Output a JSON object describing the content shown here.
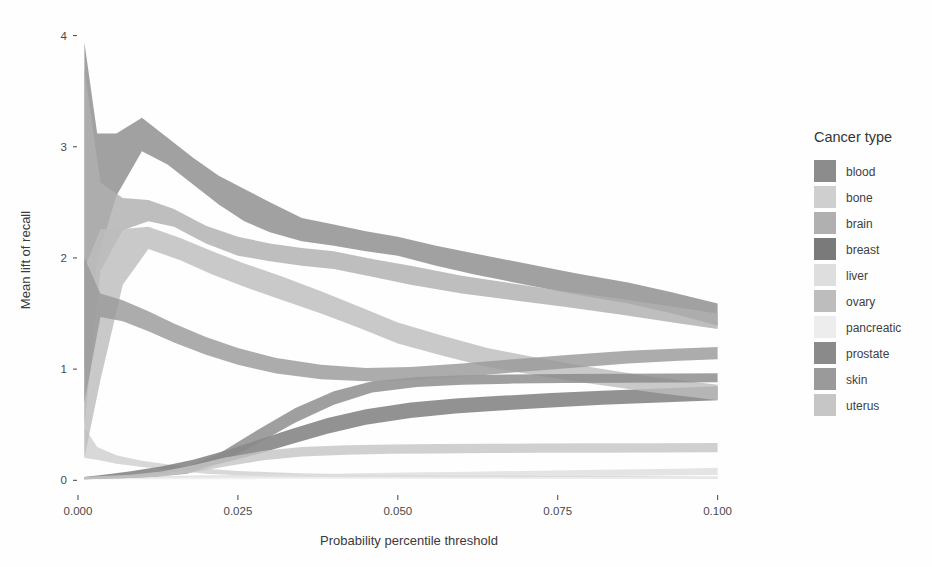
{
  "chart_data": {
    "type": "area",
    "title": "",
    "xlabel": "Probability percentile threshold",
    "ylabel": "Mean lift of recall",
    "xlim": [
      0.0,
      0.1035
    ],
    "ylim": [
      -0.06,
      4.05
    ],
    "xticks": [
      0.0,
      0.025,
      0.05,
      0.075,
      0.1
    ],
    "xtick_labels": [
      "0.000",
      "0.025",
      "0.050",
      "0.075",
      "0.100"
    ],
    "yticks": [
      0,
      1,
      2,
      3,
      4
    ],
    "ytick_labels": [
      "0",
      "1",
      "2",
      "3",
      "4"
    ],
    "grid": false,
    "legend_position": "right",
    "legend_title": "Cancer type",
    "band_semantics": "each series is a shaded ribbon (confidence interval) between lower and upper bounds",
    "series": [
      {
        "name": "blood",
        "color": "#8c8c8c",
        "x": [
          0.001,
          0.003,
          0.006,
          0.01,
          0.014,
          0.018,
          0.022,
          0.026,
          0.03,
          0.035,
          0.04,
          0.045,
          0.05,
          0.056,
          0.062,
          0.07,
          0.078,
          0.086,
          0.093,
          0.1
        ],
        "lower": [
          0.98,
          1.98,
          2.56,
          2.96,
          2.84,
          2.66,
          2.48,
          2.33,
          2.23,
          2.15,
          2.11,
          2.06,
          2.02,
          1.93,
          1.85,
          1.76,
          1.67,
          1.59,
          1.5,
          1.39
        ],
        "upper": [
          3.94,
          3.12,
          3.12,
          3.26,
          3.08,
          2.9,
          2.74,
          2.62,
          2.5,
          2.36,
          2.3,
          2.24,
          2.19,
          2.11,
          2.04,
          1.95,
          1.86,
          1.78,
          1.69,
          1.59
        ],
        "mean": [
          2.46,
          2.55,
          2.84,
          3.11,
          2.96,
          2.78,
          2.61,
          2.475,
          2.365,
          2.255,
          2.205,
          2.15,
          2.105,
          2.02,
          1.945,
          1.855,
          1.765,
          1.685,
          1.595,
          1.49
        ]
      },
      {
        "name": "bone",
        "color": "#cfcfcf",
        "x": [
          0.001,
          0.003,
          0.006,
          0.01,
          0.015,
          0.02,
          0.025,
          0.03,
          0.036,
          0.042,
          0.05,
          0.058,
          0.066,
          0.074,
          0.083,
          0.092,
          0.1
        ],
        "lower": [
          0.2,
          0.185,
          0.15,
          0.12,
          0.09,
          0.06,
          0.045,
          0.035,
          0.03,
          0.026,
          0.024,
          0.022,
          0.02,
          0.018,
          0.016,
          0.014,
          0.012
        ],
        "upper": [
          0.48,
          0.3,
          0.225,
          0.175,
          0.135,
          0.105,
          0.085,
          0.072,
          0.062,
          0.055,
          0.05,
          0.046,
          0.043,
          0.04,
          0.038,
          0.036,
          0.035
        ],
        "mean": [
          0.34,
          0.243,
          0.188,
          0.148,
          0.113,
          0.083,
          0.065,
          0.054,
          0.046,
          0.041,
          0.037,
          0.034,
          0.032,
          0.029,
          0.027,
          0.025,
          0.024
        ]
      },
      {
        "name": "brain",
        "color": "#b0b0b0",
        "x": [
          0.001,
          0.0035,
          0.007,
          0.011,
          0.015,
          0.02,
          0.025,
          0.03,
          0.035,
          0.04,
          0.046,
          0.052,
          0.06,
          0.068,
          0.076,
          0.085,
          0.093,
          0.1
        ],
        "lower": [
          0.48,
          1.88,
          2.25,
          2.33,
          2.28,
          2.13,
          2.02,
          1.97,
          1.93,
          1.9,
          1.83,
          1.76,
          1.68,
          1.62,
          1.56,
          1.49,
          1.42,
          1.36
        ],
        "upper": [
          3.7,
          2.68,
          2.54,
          2.52,
          2.44,
          2.29,
          2.19,
          2.13,
          2.09,
          2.06,
          1.99,
          1.93,
          1.84,
          1.77,
          1.7,
          1.63,
          1.56,
          1.5
        ],
        "mean": [
          2.09,
          2.28,
          2.395,
          2.425,
          2.36,
          2.21,
          2.105,
          2.05,
          2.01,
          1.98,
          1.91,
          1.845,
          1.76,
          1.695,
          1.63,
          1.56,
          1.49,
          1.43
        ]
      },
      {
        "name": "breast",
        "color": "#7a7a7a",
        "x": [
          0.001,
          0.004,
          0.008,
          0.013,
          0.018,
          0.023,
          0.028,
          0.033,
          0.039,
          0.045,
          0.052,
          0.059,
          0.066,
          0.074,
          0.082,
          0.091,
          0.1
        ],
        "lower": [
          0.01,
          0.02,
          0.035,
          0.06,
          0.1,
          0.16,
          0.235,
          0.32,
          0.42,
          0.5,
          0.56,
          0.6,
          0.628,
          0.655,
          0.68,
          0.7,
          0.72
        ],
        "upper": [
          0.03,
          0.05,
          0.08,
          0.125,
          0.185,
          0.265,
          0.36,
          0.455,
          0.56,
          0.64,
          0.7,
          0.735,
          0.76,
          0.785,
          0.805,
          0.825,
          0.845
        ],
        "mean": [
          0.02,
          0.035,
          0.058,
          0.093,
          0.143,
          0.213,
          0.298,
          0.388,
          0.49,
          0.57,
          0.63,
          0.668,
          0.694,
          0.72,
          0.743,
          0.763,
          0.783
        ]
      },
      {
        "name": "liver",
        "color": "#dedede",
        "x": [
          0.001,
          0.004,
          0.008,
          0.013,
          0.019,
          0.025,
          0.032,
          0.039,
          0.046,
          0.054,
          0.062,
          0.07,
          0.079,
          0.088,
          0.094,
          0.1
        ],
        "lower": [
          0.01,
          0.012,
          0.015,
          0.018,
          0.02,
          0.022,
          0.024,
          0.026,
          0.028,
          0.03,
          0.032,
          0.035,
          0.038,
          0.042,
          0.045,
          0.048
        ],
        "upper": [
          0.03,
          0.032,
          0.036,
          0.04,
          0.044,
          0.048,
          0.054,
          0.06,
          0.066,
          0.072,
          0.078,
          0.085,
          0.092,
          0.1,
          0.105,
          0.112
        ],
        "mean": [
          0.02,
          0.022,
          0.026,
          0.029,
          0.032,
          0.035,
          0.039,
          0.043,
          0.047,
          0.051,
          0.055,
          0.06,
          0.065,
          0.071,
          0.075,
          0.08
        ]
      },
      {
        "name": "ovary",
        "color": "#bdbdbd",
        "x": [
          0.001,
          0.0035,
          0.007,
          0.011,
          0.016,
          0.021,
          0.026,
          0.032,
          0.038,
          0.044,
          0.05,
          0.057,
          0.064,
          0.072,
          0.08,
          0.09,
          0.1
        ],
        "lower": [
          0.2,
          0.9,
          1.76,
          2.08,
          1.98,
          1.85,
          1.74,
          1.62,
          1.5,
          1.37,
          1.23,
          1.12,
          1.02,
          0.94,
          0.87,
          0.79,
          0.72
        ],
        "upper": [
          1.9,
          2.26,
          2.26,
          2.28,
          2.18,
          2.06,
          1.95,
          1.83,
          1.7,
          1.56,
          1.42,
          1.3,
          1.19,
          1.1,
          1.02,
          0.93,
          0.86
        ],
        "mean": [
          1.05,
          1.58,
          2.01,
          2.18,
          2.08,
          1.955,
          1.845,
          1.725,
          1.6,
          1.465,
          1.325,
          1.21,
          1.105,
          1.02,
          0.945,
          0.86,
          0.79
        ]
      },
      {
        "name": "pancreatic",
        "color": "#ededed",
        "x": [
          0.001,
          0.005,
          0.01,
          0.016,
          0.022,
          0.029,
          0.036,
          0.044,
          0.052,
          0.06,
          0.069,
          0.078,
          0.088,
          0.1
        ],
        "lower": [
          0.01,
          0.01,
          0.01,
          0.01,
          0.01,
          0.011,
          0.011,
          0.012,
          0.012,
          0.013,
          0.013,
          0.014,
          0.014,
          0.015
        ],
        "upper": [
          0.026,
          0.026,
          0.026,
          0.027,
          0.027,
          0.028,
          0.028,
          0.029,
          0.03,
          0.03,
          0.031,
          0.032,
          0.033,
          0.034
        ],
        "mean": [
          0.018,
          0.018,
          0.018,
          0.019,
          0.019,
          0.02,
          0.02,
          0.021,
          0.021,
          0.022,
          0.022,
          0.023,
          0.024,
          0.025
        ]
      },
      {
        "name": "prostate",
        "color": "#8a8a8a",
        "x": [
          0.001,
          0.004,
          0.008,
          0.012,
          0.017,
          0.022,
          0.028,
          0.034,
          0.04,
          0.046,
          0.053,
          0.06,
          0.068,
          0.076,
          0.085,
          0.093,
          0.1
        ],
        "lower": [
          0.01,
          0.015,
          0.022,
          0.032,
          0.06,
          0.15,
          0.33,
          0.52,
          0.68,
          0.79,
          0.84,
          0.86,
          0.87,
          0.875,
          0.878,
          0.88,
          0.882
        ],
        "upper": [
          0.03,
          0.04,
          0.055,
          0.075,
          0.12,
          0.24,
          0.45,
          0.65,
          0.8,
          0.89,
          0.93,
          0.945,
          0.952,
          0.956,
          0.958,
          0.96,
          0.962
        ],
        "mean": [
          0.02,
          0.028,
          0.039,
          0.054,
          0.09,
          0.195,
          0.39,
          0.585,
          0.74,
          0.84,
          0.885,
          0.903,
          0.911,
          0.916,
          0.918,
          0.92,
          0.922
        ]
      },
      {
        "name": "skin",
        "color": "#9a9a9a",
        "x": [
          0.001,
          0.0035,
          0.007,
          0.011,
          0.015,
          0.02,
          0.025,
          0.031,
          0.038,
          0.045,
          0.052,
          0.06,
          0.068,
          0.077,
          0.086,
          0.094,
          0.1
        ],
        "lower": [
          0.7,
          1.47,
          1.43,
          1.34,
          1.24,
          1.13,
          1.04,
          0.96,
          0.91,
          0.89,
          0.9,
          0.93,
          0.97,
          1.01,
          1.05,
          1.075,
          1.09
        ],
        "upper": [
          2.0,
          1.68,
          1.62,
          1.52,
          1.41,
          1.29,
          1.19,
          1.1,
          1.04,
          1.01,
          1.02,
          1.05,
          1.09,
          1.13,
          1.165,
          1.185,
          1.2
        ],
        "mean": [
          1.35,
          1.575,
          1.525,
          1.43,
          1.325,
          1.21,
          1.115,
          1.03,
          0.975,
          0.95,
          0.96,
          0.99,
          1.03,
          1.07,
          1.108,
          1.13,
          1.145
        ]
      },
      {
        "name": "uterus",
        "color": "#c6c6c6",
        "x": [
          0.001,
          0.004,
          0.008,
          0.013,
          0.018,
          0.023,
          0.029,
          0.035,
          0.042,
          0.049,
          0.056,
          0.064,
          0.072,
          0.081,
          0.09,
          0.1
        ],
        "lower": [
          0.01,
          0.014,
          0.02,
          0.035,
          0.07,
          0.125,
          0.18,
          0.215,
          0.23,
          0.238,
          0.242,
          0.245,
          0.247,
          0.249,
          0.25,
          0.252
        ],
        "upper": [
          0.03,
          0.038,
          0.05,
          0.08,
          0.135,
          0.205,
          0.265,
          0.3,
          0.315,
          0.322,
          0.326,
          0.329,
          0.331,
          0.333,
          0.334,
          0.336
        ],
        "mean": [
          0.02,
          0.026,
          0.035,
          0.058,
          0.103,
          0.165,
          0.223,
          0.258,
          0.273,
          0.28,
          0.284,
          0.287,
          0.289,
          0.291,
          0.292,
          0.294
        ]
      }
    ]
  },
  "plot": {
    "background": "#fefefe",
    "panel_background": "#ffffff"
  },
  "legend": {
    "title": "Cancer type",
    "items": [
      {
        "label": "blood",
        "color": "#8c8c8c"
      },
      {
        "label": "bone",
        "color": "#cfcfcf"
      },
      {
        "label": "brain",
        "color": "#b0b0b0"
      },
      {
        "label": "breast",
        "color": "#7a7a7a"
      },
      {
        "label": "liver",
        "color": "#dedede"
      },
      {
        "label": "ovary",
        "color": "#bdbdbd"
      },
      {
        "label": "pancreatic",
        "color": "#ededed"
      },
      {
        "label": "prostate",
        "color": "#8a8a8a"
      },
      {
        "label": "skin",
        "color": "#9a9a9a"
      },
      {
        "label": "uterus",
        "color": "#c6c6c6"
      }
    ]
  }
}
